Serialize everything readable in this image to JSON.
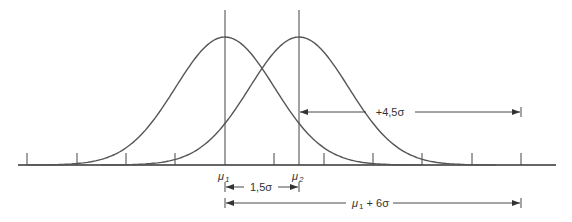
{
  "diagram": {
    "type": "two normal distributions, shifted mean",
    "colors": {
      "curve": "#555555",
      "axis": "#333333",
      "line": "#444444",
      "background": "#ffffff"
    },
    "axis": {
      "sigma_px": 49.4,
      "mu1_x": 225,
      "ticks_sigma_from_mu1": [
        -4,
        -3,
        -2,
        -1,
        0,
        1,
        2,
        3,
        4,
        5,
        6
      ]
    },
    "labels": {
      "mu1": {
        "sym": "μ",
        "sub": "1"
      },
      "mu2": {
        "sym": "μ",
        "sub": "2"
      },
      "shift": "1,5σ",
      "right_tail": "+4,5σ",
      "spec_limit": {
        "sym": "μ",
        "sub": "1",
        "rest": " + 6σ"
      }
    },
    "curves": [
      {
        "name": "distribution-1",
        "mean": "μ1",
        "mean_offset_sigma": 0
      },
      {
        "name": "distribution-2",
        "mean": "μ2",
        "mean_offset_sigma": 1.5
      }
    ]
  }
}
